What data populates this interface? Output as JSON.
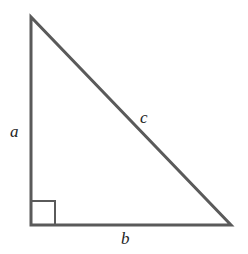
{
  "diagram": {
    "type": "right-triangle",
    "stroke_color": "#5a5a5a",
    "background": "#ffffff",
    "vertices": {
      "top": [
        31,
        17
      ],
      "right_angle": [
        31,
        225
      ],
      "bottom_right": [
        231,
        225
      ]
    },
    "right_angle_marker_size": 24,
    "labels": {
      "a": "a",
      "b": "b",
      "c": "c"
    }
  }
}
